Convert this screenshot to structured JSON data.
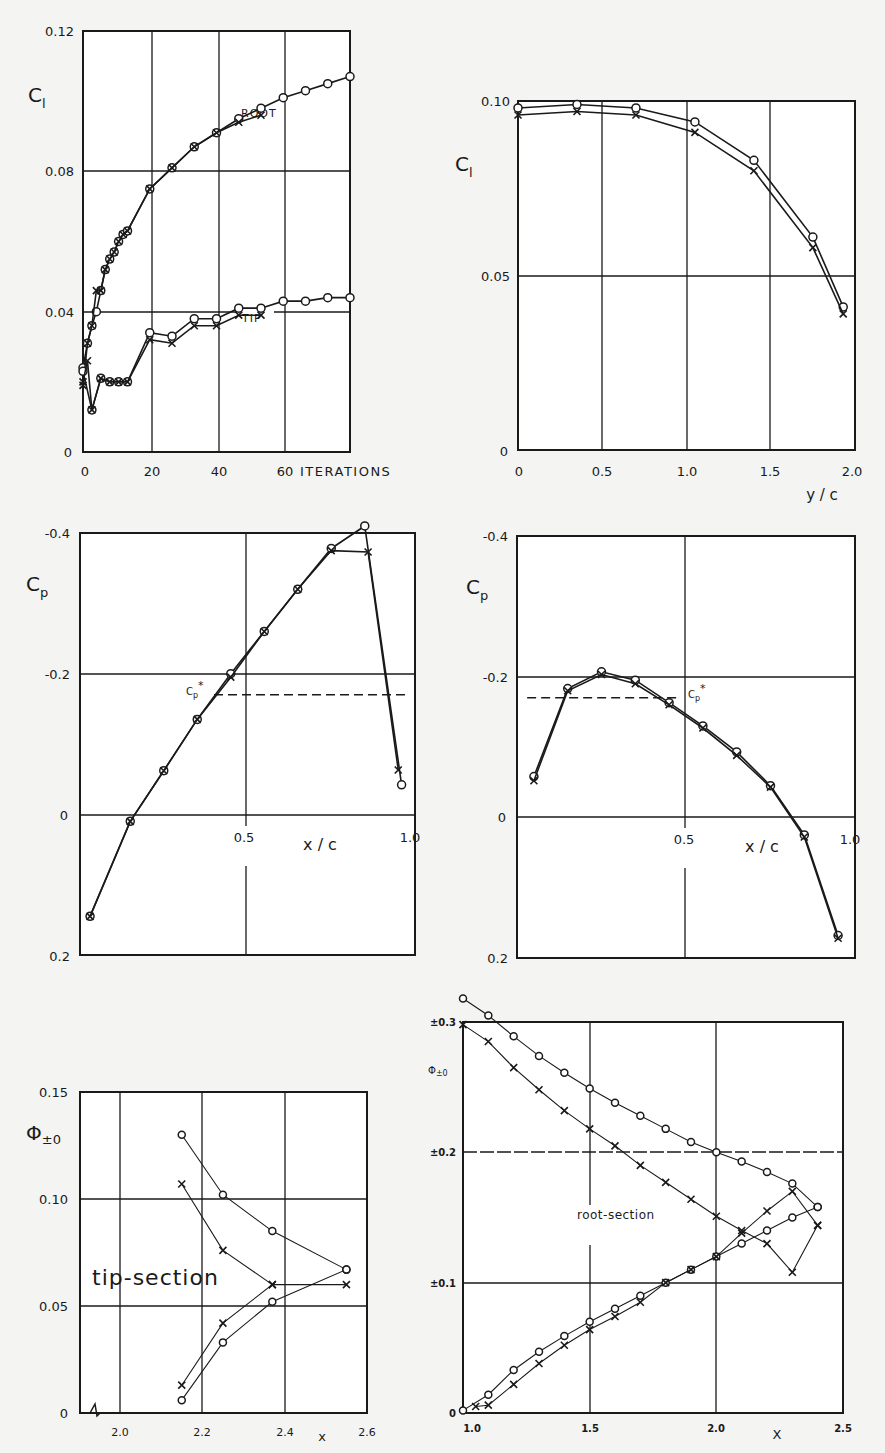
{
  "chart_data": [
    {
      "id": "cl-iterations",
      "type": "line",
      "title": "",
      "xlabel": "ITERATIONS",
      "ylabel": "C_l",
      "x_ticks": [
        "0",
        "20",
        "40",
        "60"
      ],
      "y_ticks": [
        "0",
        "0.04",
        "0.08",
        "0.12"
      ],
      "xlim": [
        0,
        60
      ],
      "ylim": [
        0,
        0.12
      ],
      "grid": true,
      "annotations": [
        "ROOT",
        "TIP"
      ],
      "series": [
        {
          "name": "ROOT (o)",
          "marker": "circle",
          "x": [
            0,
            1,
            2,
            3,
            4,
            5,
            6,
            7,
            8,
            9,
            10,
            15,
            20,
            25,
            30,
            35,
            40,
            45,
            50,
            55,
            60
          ],
          "y": [
            0.024,
            0.031,
            0.036,
            0.04,
            0.046,
            0.052,
            0.055,
            0.057,
            0.06,
            0.062,
            0.063,
            0.075,
            0.081,
            0.087,
            0.091,
            0.095,
            0.098,
            0.101,
            0.103,
            0.105,
            0.107
          ]
        },
        {
          "name": "ROOT (x)",
          "marker": "x",
          "x": [
            0,
            1,
            2,
            3,
            4,
            5,
            6,
            7,
            8,
            9,
            10,
            15,
            20,
            25,
            30,
            35,
            40
          ],
          "y": [
            0.019,
            0.031,
            0.036,
            0.046,
            0.046,
            0.052,
            0.055,
            0.057,
            0.06,
            0.062,
            0.063,
            0.075,
            0.081,
            0.087,
            0.091,
            0.094,
            0.096
          ]
        },
        {
          "name": "TIP (o)",
          "marker": "circle",
          "x": [
            0,
            2,
            4,
            6,
            8,
            10,
            15,
            20,
            25,
            30,
            35,
            40,
            45,
            50,
            55,
            60
          ],
          "y": [
            0.023,
            0.012,
            0.021,
            0.02,
            0.02,
            0.02,
            0.034,
            0.033,
            0.038,
            0.038,
            0.041,
            0.041,
            0.043,
            0.043,
            0.044,
            0.044
          ]
        },
        {
          "name": "TIP (x)",
          "marker": "x",
          "x": [
            0,
            1,
            2,
            4,
            6,
            8,
            10,
            15,
            20,
            25,
            30,
            35,
            40
          ],
          "y": [
            0.02,
            0.026,
            0.012,
            0.021,
            0.02,
            0.02,
            0.02,
            0.032,
            0.031,
            0.036,
            0.036,
            0.039,
            0.039
          ]
        }
      ]
    },
    {
      "id": "cl-spanwise",
      "type": "line",
      "title": "",
      "xlabel": "y/c",
      "ylabel": "C_l",
      "x_ticks": [
        "0",
        "0.5",
        "1.0",
        "1.5",
        "2.0"
      ],
      "y_ticks": [
        "0",
        "0.05",
        "0.10"
      ],
      "xlim": [
        0,
        2.0
      ],
      "ylim": [
        0,
        0.1
      ],
      "grid": true,
      "series": [
        {
          "name": "o",
          "marker": "circle",
          "x": [
            0,
            0.35,
            0.7,
            1.05,
            1.4,
            1.75,
            1.93
          ],
          "y": [
            0.098,
            0.099,
            0.098,
            0.094,
            0.083,
            0.061,
            0.041
          ]
        },
        {
          "name": "x",
          "marker": "x",
          "x": [
            0,
            0.35,
            0.7,
            1.05,
            1.4,
            1.75,
            1.93
          ],
          "y": [
            0.096,
            0.097,
            0.096,
            0.091,
            0.08,
            0.058,
            0.039
          ]
        }
      ]
    },
    {
      "id": "cp-root",
      "type": "line",
      "title": "",
      "xlabel": "x/c",
      "ylabel": "C_p",
      "x_ticks": [
        "0.5",
        "1.0"
      ],
      "y_ticks": [
        "-0.4",
        "-0.2",
        "0",
        "0.2"
      ],
      "xlim": [
        0,
        1.0
      ],
      "ylim": [
        0.2,
        -0.4
      ],
      "grid": true,
      "annotations": [
        "C_p*"
      ],
      "reference_line": {
        "label": "C_p*",
        "y": -0.17,
        "x_from": 0.4,
        "x_to": 0.97,
        "style": "dashed"
      },
      "series": [
        {
          "name": "o",
          "marker": "circle",
          "x": [
            0.03,
            0.15,
            0.25,
            0.35,
            0.45,
            0.55,
            0.65,
            0.75,
            0.85,
            0.96
          ],
          "y": [
            0.145,
            0.01,
            -0.062,
            -0.135,
            -0.2,
            -0.26,
            -0.32,
            -0.378,
            -0.41,
            -0.042
          ]
        },
        {
          "name": "x",
          "marker": "x",
          "x": [
            0.03,
            0.15,
            0.25,
            0.35,
            0.45,
            0.55,
            0.65,
            0.75,
            0.86,
            0.95
          ],
          "y": [
            0.145,
            0.01,
            -0.062,
            -0.135,
            -0.195,
            -0.26,
            -0.32,
            -0.375,
            -0.373,
            -0.063
          ]
        }
      ]
    },
    {
      "id": "cp-tip",
      "type": "line",
      "title": "",
      "xlabel": "x/c",
      "ylabel": "C_p",
      "x_ticks": [
        "0.5",
        "1.0"
      ],
      "y_ticks": [
        "-0.4",
        "-0.2",
        "0",
        "0.2"
      ],
      "xlim": [
        0,
        1.0
      ],
      "ylim": [
        0.2,
        -0.4
      ],
      "grid": true,
      "annotations": [
        "C_p*"
      ],
      "reference_line": {
        "label": "C_p*",
        "y": -0.17,
        "x_from": 0.03,
        "x_to": 0.48,
        "style": "dashed"
      },
      "series": [
        {
          "name": "o",
          "marker": "circle",
          "x": [
            0.05,
            0.15,
            0.25,
            0.35,
            0.45,
            0.55,
            0.65,
            0.75,
            0.85,
            0.95
          ],
          "y": [
            -0.058,
            -0.183,
            -0.207,
            -0.195,
            -0.163,
            -0.13,
            -0.093,
            -0.045,
            0.025,
            0.168
          ]
        },
        {
          "name": "x",
          "marker": "x",
          "x": [
            0.05,
            0.15,
            0.25,
            0.35,
            0.45,
            0.55,
            0.65,
            0.75,
            0.85,
            0.95
          ],
          "y": [
            -0.052,
            -0.18,
            -0.203,
            -0.19,
            -0.16,
            -0.127,
            -0.088,
            -0.043,
            0.028,
            0.172
          ]
        }
      ]
    },
    {
      "id": "phi-tip-section",
      "type": "line",
      "title": "",
      "xlabel": "x",
      "ylabel": "Φ_±0",
      "x_ticks": [
        "2.0",
        "2.2",
        "2.4",
        "2.6"
      ],
      "y_ticks": [
        "0",
        "0.05",
        "0.10",
        "0.15"
      ],
      "xlim": [
        1.9,
        2.6
      ],
      "ylim": [
        0,
        0.15
      ],
      "grid": true,
      "annotations": [
        "tip-section"
      ],
      "series": [
        {
          "name": "o upper",
          "marker": "circle",
          "x": [
            2.15,
            2.25,
            2.37,
            2.55
          ],
          "y": [
            0.13,
            0.102,
            0.085,
            0.067
          ]
        },
        {
          "name": "o lower",
          "marker": "circle",
          "x": [
            2.15,
            2.25,
            2.37,
            2.55
          ],
          "y": [
            0.006,
            0.033,
            0.052,
            0.067
          ]
        },
        {
          "name": "x upper",
          "marker": "x",
          "x": [
            2.15,
            2.25,
            2.37
          ],
          "y": [
            0.107,
            0.076,
            0.06
          ]
        },
        {
          "name": "x lower",
          "marker": "x",
          "x": [
            2.15,
            2.25,
            2.37,
            2.55
          ],
          "y": [
            0.013,
            0.042,
            0.06,
            0.06
          ]
        }
      ]
    },
    {
      "id": "phi-root-section",
      "type": "line",
      "title": "",
      "xlabel": "X",
      "ylabel": "Φ_±0",
      "x_ticks": [
        "1.0",
        "1.5",
        "2.0",
        "2.5"
      ],
      "y_ticks": [
        "0",
        "±0.1",
        "±0.2",
        "±0.3"
      ],
      "xlim": [
        1.0,
        2.5
      ],
      "ylim": [
        0,
        0.3
      ],
      "grid": true,
      "annotations": [
        "root-section"
      ],
      "series": [
        {
          "name": "o upper",
          "marker": "circle",
          "x": [
            1.0,
            1.1,
            1.2,
            1.3,
            1.4,
            1.5,
            1.6,
            1.7,
            1.8,
            1.9,
            2.0,
            2.1,
            2.2,
            2.3,
            2.4
          ],
          "y": [
            0.318,
            0.305,
            0.289,
            0.274,
            0.261,
            0.249,
            0.238,
            0.228,
            0.218,
            0.208,
            0.2,
            0.193,
            0.185,
            0.176,
            0.158
          ]
        },
        {
          "name": "x upper",
          "marker": "x",
          "x": [
            1.0,
            1.1,
            1.2,
            1.3,
            1.4,
            1.5,
            1.6,
            1.7,
            1.8,
            1.9,
            2.0,
            2.1,
            2.2,
            2.3,
            2.4
          ],
          "y": [
            0.298,
            0.285,
            0.265,
            0.248,
            0.232,
            0.218,
            0.205,
            0.19,
            0.177,
            0.164,
            0.151,
            0.14,
            0.13,
            0.108,
            0.144
          ]
        },
        {
          "name": "o lower",
          "marker": "circle",
          "x": [
            1.0,
            1.1,
            1.2,
            1.3,
            1.4,
            1.5,
            1.6,
            1.7,
            1.8,
            1.9,
            2.0,
            2.1,
            2.2,
            2.3,
            2.4
          ],
          "y": [
            0.002,
            0.014,
            0.033,
            0.047,
            0.059,
            0.07,
            0.08,
            0.09,
            0.1,
            0.11,
            0.12,
            0.13,
            0.14,
            0.15,
            0.158
          ]
        },
        {
          "name": "x lower",
          "marker": "x",
          "x": [
            1.05,
            1.1,
            1.2,
            1.3,
            1.4,
            1.5,
            1.6,
            1.7,
            1.8,
            1.9,
            2.0,
            2.1,
            2.2,
            2.3,
            2.4
          ],
          "y": [
            0.005,
            0.006,
            0.022,
            0.038,
            0.052,
            0.064,
            0.074,
            0.085,
            0.1,
            0.11,
            0.12,
            0.138,
            0.155,
            0.17,
            0.144
          ]
        }
      ]
    }
  ],
  "labels": {
    "a_ylabel": "C",
    "a_ylabel_sub": "l",
    "a_xlabel": "ITERATIONS",
    "a_root": "ROOT",
    "a_tip": "TIP",
    "b_ylabel": "C",
    "b_ylabel_sub": "l",
    "b_xlabel": "y / c",
    "c_ylabel": "C",
    "c_ylabel_sub": "p",
    "c_xlabel": "x / c",
    "c_cpstar": "C",
    "c_cpstar_sub": "p",
    "c_cpstar_sup": "*",
    "d_ylabel": "C",
    "d_ylabel_sub": "p",
    "d_xlabel": "x / c",
    "e_ylabel": "Φ",
    "e_ylabel_sub": "±0",
    "e_xlabel": "x",
    "e_note": "tip-section",
    "f_ylabel": "Φ",
    "f_ylabel_sub": "±0",
    "f_xlabel": "X",
    "f_note": "root-section"
  },
  "ticks": {
    "a_x": [
      "0",
      "20",
      "40",
      "60"
    ],
    "a_y": [
      "0",
      "0.04",
      "0.08",
      "0.12"
    ],
    "b_x": [
      "0",
      "0.5",
      "1.0",
      "1.5",
      "2.0"
    ],
    "b_y": [
      "0",
      "0.05",
      "0.10"
    ],
    "c_x": [
      "0.5",
      "1.0"
    ],
    "c_y": [
      "-0.4",
      "-0.2",
      "0",
      "0.2"
    ],
    "d_x": [
      "0.5",
      "1.0"
    ],
    "d_y": [
      "-0.4",
      "-0.2",
      "0",
      "0.2"
    ],
    "e_x": [
      "2.0",
      "2.2",
      "2.4",
      "2.6"
    ],
    "e_y": [
      "0",
      "0.05",
      "0.10",
      "0.15"
    ],
    "f_x": [
      "1.0",
      "1.5",
      "2.0",
      "2.5"
    ],
    "f_y": [
      "0",
      "±0.1",
      "±0.2",
      "±0.3"
    ]
  }
}
